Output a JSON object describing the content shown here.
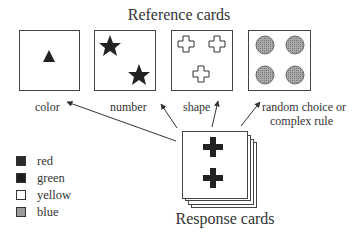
{
  "diagram": {
    "reference_title": "Reference cards",
    "response_title": "Response cards",
    "reference_cards": [
      {
        "id": "card-color",
        "shape": "triangle",
        "count": 1,
        "fill": "black",
        "label": "color"
      },
      {
        "id": "card-number",
        "shape": "star",
        "count": 2,
        "fill": "black",
        "label": "number"
      },
      {
        "id": "card-shape",
        "shape": "cross",
        "count": 3,
        "fill": "white-outline",
        "label": "shape"
      },
      {
        "id": "card-random",
        "shape": "circle",
        "count": 4,
        "fill": "hatched-gray",
        "label": "random choice or complex rule"
      }
    ],
    "labels": {
      "color": "color",
      "number": "number",
      "shape": "shape",
      "random_line1": "random choice or",
      "random_line2": "complex rule"
    },
    "response_card": {
      "shape": "cross",
      "count": 2,
      "fill": "black",
      "stack_depth": 4
    },
    "legend": [
      {
        "label": "red",
        "swatch": "#2a2a2a"
      },
      {
        "label": "green",
        "swatch": "#1e1e1e"
      },
      {
        "label": "yellow",
        "swatch": "#ffffff"
      },
      {
        "label": "blue",
        "swatch": "#9a9a9a"
      }
    ]
  }
}
